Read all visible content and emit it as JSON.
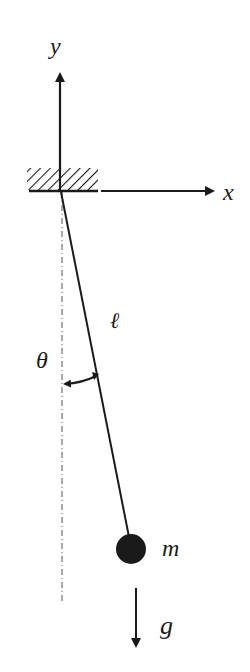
{
  "diagram": {
    "type": "simple-pendulum",
    "labels": {
      "y_axis": "y",
      "x_axis": "x",
      "length": "ℓ",
      "angle": "θ",
      "mass": "m",
      "gravity": "g"
    },
    "colors": {
      "ink": "#1a1a1a",
      "background": "#ffffff"
    }
  }
}
